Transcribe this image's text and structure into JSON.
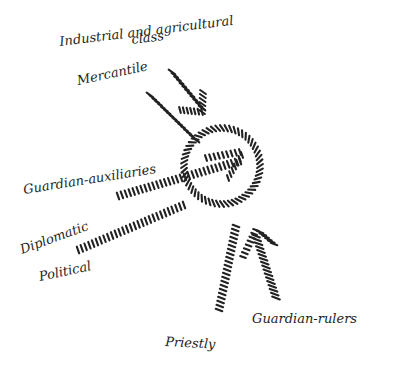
{
  "diagram": {
    "center_label": "",
    "labels": {
      "industrial": [
        "Industrial and agricultural",
        "class"
      ],
      "mercantile": "Mercantile",
      "guardian_auxiliaries": "Guardian-auxiliaries",
      "diplomatic": "Diplomatic",
      "political": "Political",
      "priestly": "Priestly",
      "guardian_rulers": "Guardian-rulers"
    },
    "ink_color": "#222222",
    "arrows": [
      {
        "id": "industrial-arrow",
        "from": "industrial",
        "to": "circle",
        "direction": "inward",
        "arrowhead": true
      },
      {
        "id": "mercantile-line",
        "from": "mercantile",
        "to": "circle",
        "direction": "inward",
        "arrowhead": false
      },
      {
        "id": "guardian-auxiliaries-arrow",
        "from": "guardian_auxiliaries",
        "to": "circle-center",
        "direction": "inward",
        "arrowhead": true
      },
      {
        "id": "diplomatic-line",
        "from": "diplomatic",
        "to": "circle",
        "direction": "inward",
        "arrowhead": false
      },
      {
        "id": "priestly-line",
        "from": "priestly",
        "to": "circle",
        "direction": "inward",
        "arrowhead": false
      },
      {
        "id": "guardian-rulers-arrow",
        "from": "guardian_rulers",
        "to": "circle",
        "direction": "inward",
        "arrowhead": true
      }
    ]
  }
}
